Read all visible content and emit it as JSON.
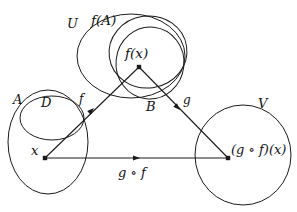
{
  "figure": {
    "kind": "function-composition-diagram",
    "stroke_color": "#1a1a1a",
    "background": "#ffffff",
    "width": 297,
    "height": 212
  },
  "sets": {
    "domain_outer": {
      "label": "A",
      "cx": 48,
      "cy": 142,
      "rx": 40,
      "ry": 52,
      "label_x": 13,
      "label_y": 93
    },
    "domain_inner": {
      "label": "D",
      "cx": 52,
      "cy": 118,
      "rx": 32,
      "ry": 22,
      "label_x": 41,
      "label_y": 96
    },
    "codomain_outer": {
      "label": "U",
      "cx": 131,
      "cy": 56,
      "rx": 54,
      "ry": 42,
      "label_x": 67,
      "label_y": 17
    },
    "image_set": {
      "label": "f(A)",
      "cx": 148,
      "cy": 52,
      "rx": 39,
      "ry": 36,
      "label_x": 91,
      "label_y": 14
    },
    "middle_set": {
      "label": "B",
      "cx": 150,
      "cy": 63,
      "rx": 34,
      "ry": 36,
      "label_x": 146,
      "label_y": 100
    },
    "target": {
      "label": "V",
      "cx": 243,
      "cy": 155,
      "rx": 48,
      "ry": 50,
      "label_x": 258,
      "label_y": 97
    }
  },
  "points": {
    "x": {
      "label": "x",
      "px": 45,
      "py": 158,
      "label_x": 31,
      "label_y": 144
    },
    "fx": {
      "label": "f(x)",
      "px": 139,
      "py": 67,
      "label_x": 125,
      "label_y": 47
    },
    "gfx": {
      "label": "(g ∘ f)(x)",
      "px": 228,
      "py": 158,
      "label_x": 231,
      "label_y": 143
    }
  },
  "arrows": {
    "f": {
      "label": "f",
      "x1": 45,
      "y1": 158,
      "x2": 139,
      "y2": 67,
      "label_x": 79,
      "label_y": 93
    },
    "g": {
      "label": "g",
      "x1": 139,
      "y1": 67,
      "x2": 228,
      "y2": 158,
      "label_x": 183,
      "label_y": 94
    },
    "gof": {
      "label": "g ∘ f",
      "x1": 45,
      "y1": 158,
      "x2": 228,
      "y2": 158,
      "label_x": 118,
      "label_y": 166
    }
  }
}
